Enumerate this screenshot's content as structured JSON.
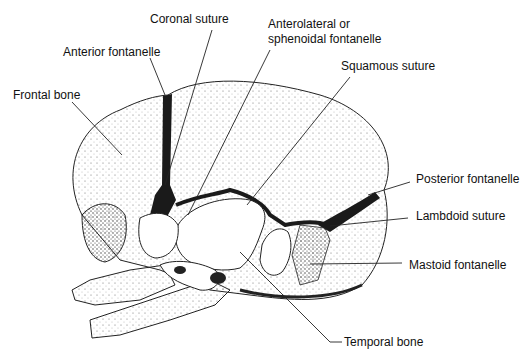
{
  "diagram": {
    "title": "",
    "labels": {
      "coronal_suture": "Coronal suture",
      "anterior_fontanelle": "Anterior fontanelle",
      "frontal_bone": "Frontal bone",
      "anterolateral_line1": "Anterolateral or",
      "anterolateral_line2": "sphenoidal fontanelle",
      "squamous_suture": "Squamous suture",
      "posterior_fontanelle": "Posterior fontanelle",
      "lambdoid_suture": "Lambdoid suture",
      "mastoid_fontanelle": "Mastoid fontanelle",
      "temporal_bone": "Temporal bone"
    },
    "colors": {
      "ink": "#111111",
      "background": "#ffffff",
      "fontanelle_fill": "#1a1a1a"
    }
  }
}
